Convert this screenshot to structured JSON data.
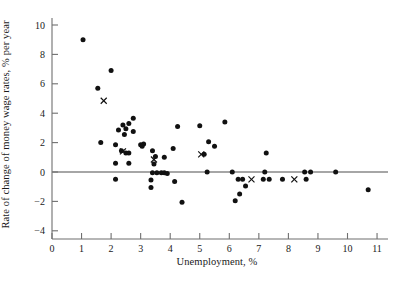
{
  "chart_data": {
    "type": "scatter",
    "title": "",
    "xlabel": "Unemployment, %",
    "ylabel": "Rate of change of money wage rates, % per year",
    "xlim": [
      0,
      11
    ],
    "ylim": [
      -4,
      10
    ],
    "xticks": [
      0,
      1,
      2,
      3,
      4,
      5,
      6,
      7,
      8,
      9,
      10,
      11
    ],
    "yticks": [
      -4,
      -2,
      0,
      2,
      4,
      6,
      8,
      10
    ],
    "xtick_labels": [
      "0",
      "1",
      "2",
      "3",
      "4",
      "5",
      "6",
      "7",
      "8",
      "9",
      "10",
      "11"
    ],
    "ytick_labels": [
      "-4",
      "-2",
      "0",
      "2",
      "4",
      "6",
      "8",
      "10"
    ],
    "grid": false,
    "legend": false,
    "zero_line": {
      "y": 0,
      "color": "#888888",
      "drawn_across_plot": true
    },
    "series": [
      {
        "name": "observations",
        "marker": "filled-circle",
        "color": "#111111",
        "points": [
          [
            1.05,
            9.0
          ],
          [
            2.0,
            6.9
          ],
          [
            1.55,
            5.7
          ],
          [
            2.4,
            3.2
          ],
          [
            2.6,
            3.3
          ],
          [
            2.75,
            3.65
          ],
          [
            2.75,
            2.75
          ],
          [
            4.25,
            3.1
          ],
          [
            5.0,
            3.15
          ],
          [
            5.85,
            3.4
          ],
          [
            2.25,
            2.85
          ],
          [
            2.5,
            2.95
          ],
          [
            2.45,
            2.55
          ],
          [
            1.65,
            2.0
          ],
          [
            2.15,
            1.85
          ],
          [
            2.35,
            1.45
          ],
          [
            2.5,
            1.3
          ],
          [
            2.6,
            1.3
          ],
          [
            3.0,
            1.85
          ],
          [
            3.1,
            1.9
          ],
          [
            3.05,
            1.75
          ],
          [
            3.4,
            1.45
          ],
          [
            4.1,
            1.6
          ],
          [
            2.15,
            0.6
          ],
          [
            2.6,
            0.6
          ],
          [
            3.5,
            1.05
          ],
          [
            3.8,
            1.0
          ],
          [
            3.45,
            0.55
          ],
          [
            5.3,
            2.05
          ],
          [
            5.5,
            1.75
          ],
          [
            5.15,
            1.2
          ],
          [
            7.25,
            1.3
          ],
          [
            2.15,
            -0.5
          ],
          [
            3.4,
            -0.05
          ],
          [
            3.55,
            -0.05
          ],
          [
            3.7,
            -0.05
          ],
          [
            3.8,
            -0.05
          ],
          [
            3.9,
            -0.1
          ],
          [
            3.35,
            -0.55
          ],
          [
            3.35,
            -1.05
          ],
          [
            4.15,
            -0.65
          ],
          [
            4.4,
            -2.05
          ],
          [
            5.25,
            0.0
          ],
          [
            6.1,
            0.0
          ],
          [
            6.3,
            -0.5
          ],
          [
            6.45,
            -0.5
          ],
          [
            6.55,
            -0.95
          ],
          [
            6.35,
            -1.5
          ],
          [
            6.2,
            -1.95
          ],
          [
            7.2,
            0.0
          ],
          [
            7.15,
            -0.5
          ],
          [
            7.35,
            -0.5
          ],
          [
            7.8,
            -0.5
          ],
          [
            8.55,
            0.0
          ],
          [
            8.75,
            0.0
          ],
          [
            8.6,
            -0.5
          ],
          [
            9.6,
            0.0
          ],
          [
            10.7,
            -1.2
          ]
        ]
      },
      {
        "name": "highlighted",
        "marker": "cross",
        "color": "#111111",
        "points": [
          [
            1.75,
            4.85
          ],
          [
            2.4,
            1.4
          ],
          [
            3.45,
            0.85
          ],
          [
            5.05,
            1.2
          ],
          [
            6.75,
            -0.5
          ],
          [
            8.2,
            -0.5
          ]
        ]
      }
    ]
  },
  "axes": {
    "x_axis_name": "unemployment-axis",
    "y_axis_name": "wage-change-axis"
  }
}
